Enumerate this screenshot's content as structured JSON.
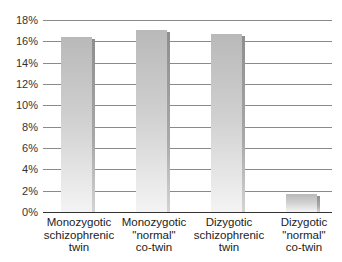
{
  "chart_data": {
    "type": "bar",
    "title": "",
    "xlabel": "",
    "ylabel": "",
    "categories": [
      "Monozygotic\nschizophrenic\ntwin",
      "Monozygotic\n\"normal\"\nco-twin",
      "Dizygotic\nschizophrenic\ntwin",
      "Dizygotic\n\"normal\"\nco-twin"
    ],
    "values": [
      16.4,
      17.1,
      16.7,
      1.7
    ],
    "unit": "%",
    "ylim": [
      0,
      18
    ],
    "yticks": [
      "0%",
      "2%",
      "4%",
      "6%",
      "8%",
      "10%",
      "12%",
      "14%",
      "16%",
      "18%"
    ],
    "grid": true,
    "legend": null
  },
  "colors": {
    "bar_top": "#b9b9b9",
    "bar_bottom": "#f4f4f4",
    "gridline": "#8a8a8a",
    "axis": "#333333"
  }
}
